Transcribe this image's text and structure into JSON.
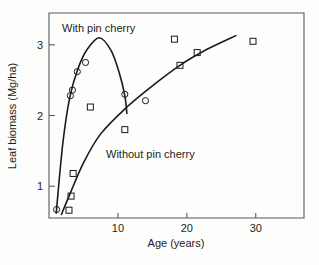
{
  "chart_data": {
    "type": "scatter",
    "title": "",
    "xlabel": "Age (years)",
    "ylabel": "Leaf biomass (Mg/ha)",
    "xlim": [
      0,
      37
    ],
    "ylim": [
      0.55,
      3.45
    ],
    "xticks": [
      10,
      20,
      30
    ],
    "xtick_labels": [
      "10",
      "20",
      "30"
    ],
    "yticks": [
      1,
      2,
      3
    ],
    "ytick_labels": [
      "1",
      "2",
      "3"
    ],
    "grid": false,
    "legend_position": "inline-annotation",
    "series": [
      {
        "name": "With pin cherry",
        "marker": "circle",
        "annotation": "With pin cherry",
        "points": [
          {
            "x": 1.1,
            "y": 0.67
          },
          {
            "x": 3.1,
            "y": 2.28
          },
          {
            "x": 3.4,
            "y": 2.36
          },
          {
            "x": 4.1,
            "y": 2.62
          },
          {
            "x": 5.3,
            "y": 2.75
          },
          {
            "x": 11.0,
            "y": 2.3
          },
          {
            "x": 14.0,
            "y": 2.21
          }
        ],
        "curve": [
          {
            "x": 1.05,
            "y": 0.62
          },
          {
            "x": 2.0,
            "y": 1.6
          },
          {
            "x": 3.0,
            "y": 2.25
          },
          {
            "x": 4.2,
            "y": 2.66
          },
          {
            "x": 5.5,
            "y": 2.93
          },
          {
            "x": 7.3,
            "y": 3.1
          },
          {
            "x": 9.0,
            "y": 2.92
          },
          {
            "x": 10.2,
            "y": 2.6
          },
          {
            "x": 11.0,
            "y": 2.28
          },
          {
            "x": 11.3,
            "y": 2.03
          }
        ]
      },
      {
        "name": "Without pin cherry",
        "marker": "square",
        "annotation": "Without pin cherry",
        "points": [
          {
            "x": 2.9,
            "y": 0.66
          },
          {
            "x": 3.2,
            "y": 0.86
          },
          {
            "x": 3.5,
            "y": 1.18
          },
          {
            "x": 6.0,
            "y": 2.12
          },
          {
            "x": 11.0,
            "y": 1.8
          },
          {
            "x": 18.2,
            "y": 3.08
          },
          {
            "x": 19.0,
            "y": 2.71
          },
          {
            "x": 21.5,
            "y": 2.89
          },
          {
            "x": 29.6,
            "y": 3.05
          }
        ],
        "curve": [
          {
            "x": 1.8,
            "y": 0.6
          },
          {
            "x": 3.0,
            "y": 0.88
          },
          {
            "x": 5.0,
            "y": 1.33
          },
          {
            "x": 7.5,
            "y": 1.74
          },
          {
            "x": 11.3,
            "y": 2.12
          },
          {
            "x": 15.0,
            "y": 2.42
          },
          {
            "x": 19.0,
            "y": 2.71
          },
          {
            "x": 23.0,
            "y": 2.94
          },
          {
            "x": 27.1,
            "y": 3.13
          }
        ]
      }
    ]
  },
  "colors": {
    "curve": "#1a1a1a",
    "axis": "#58595b",
    "text": "#231f20",
    "background": "#fdfdfc"
  }
}
